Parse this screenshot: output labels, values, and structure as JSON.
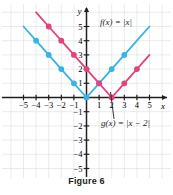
{
  "figure": {
    "caption": "Figure 6",
    "axis_labels": {
      "x": "x",
      "y": "y"
    },
    "x_ticks": [
      "-5",
      "-4",
      "-3",
      "-2",
      "-1",
      "1",
      "2",
      "3",
      "4",
      "5"
    ],
    "y_ticks": [
      "5",
      "4",
      "3",
      "2",
      "1",
      "-1",
      "-2",
      "-3",
      "-4",
      "-5"
    ]
  },
  "colors": {
    "f_curve": "#3ab3e2",
    "g_curve": "#e0447c",
    "axis": "#231f20",
    "grid": "#d9dde3",
    "caption": "#222222"
  },
  "annotations": {
    "f_label": "f(x) = |x|",
    "g_label": "g(x) = |x − 2|"
  },
  "chart_data": {
    "type": "line",
    "title": "Figure 6",
    "xlabel": "x",
    "ylabel": "y",
    "xlim": [
      -6,
      6
    ],
    "ylim": [
      -6,
      6
    ],
    "grid": true,
    "legend": "inline-annotations",
    "series": [
      {
        "name": "f(x) = |x|",
        "color": "#3ab3e2",
        "points": [
          {
            "x": -5,
            "y": 5
          },
          {
            "x": -4,
            "y": 4
          },
          {
            "x": -3,
            "y": 3
          },
          {
            "x": -2,
            "y": 2
          },
          {
            "x": -1,
            "y": 1
          },
          {
            "x": 0,
            "y": 0
          },
          {
            "x": 1,
            "y": 1
          },
          {
            "x": 2,
            "y": 2
          },
          {
            "x": 3,
            "y": 3
          },
          {
            "x": 4,
            "y": 4
          },
          {
            "x": 5,
            "y": 5
          }
        ],
        "marked_points": [
          {
            "x": -4,
            "y": 4
          },
          {
            "x": -3,
            "y": 3
          },
          {
            "x": -2,
            "y": 2
          },
          {
            "x": -1,
            "y": 1
          },
          {
            "x": 0,
            "y": 0
          },
          {
            "x": 1,
            "y": 1
          },
          {
            "x": 2,
            "y": 2
          },
          {
            "x": 3,
            "y": 3
          }
        ]
      },
      {
        "name": "g(x) = |x - 2|",
        "color": "#e0447c",
        "points": [
          {
            "x": -4,
            "y": 6
          },
          {
            "x": -3,
            "y": 5
          },
          {
            "x": -2,
            "y": 4
          },
          {
            "x": -1,
            "y": 3
          },
          {
            "x": 0,
            "y": 2
          },
          {
            "x": 1,
            "y": 1
          },
          {
            "x": 2,
            "y": 0
          },
          {
            "x": 3,
            "y": 1
          },
          {
            "x": 4,
            "y": 2
          },
          {
            "x": 5,
            "y": 3
          }
        ],
        "marked_points": [
          {
            "x": -3,
            "y": 5
          },
          {
            "x": -2,
            "y": 4
          },
          {
            "x": -1,
            "y": 3
          },
          {
            "x": 0,
            "y": 2
          },
          {
            "x": 1,
            "y": 1
          },
          {
            "x": 2,
            "y": 0
          },
          {
            "x": 3,
            "y": 1
          },
          {
            "x": 4,
            "y": 2
          }
        ]
      }
    ]
  }
}
